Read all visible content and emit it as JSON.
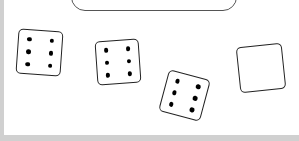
{
  "game": {
    "title": "Dice",
    "tray": {
      "label": ""
    },
    "dice": [
      {
        "id": 1,
        "value": 6,
        "left": 17,
        "top": 30,
        "size": 45,
        "rotate": 4
      },
      {
        "id": 2,
        "value": 6,
        "left": 96,
        "top": 40,
        "size": 44,
        "rotate": -4
      },
      {
        "id": 3,
        "value": 6,
        "left": 163,
        "top": 74,
        "size": 43,
        "rotate": 15
      },
      {
        "id": 4,
        "value": 0,
        "left": 238,
        "top": 45,
        "size": 46,
        "rotate": -6
      }
    ],
    "colors": {
      "border": "#d0d0d0",
      "die_outline": "#222222",
      "pip": "#000000",
      "background": "#ffffff"
    }
  }
}
